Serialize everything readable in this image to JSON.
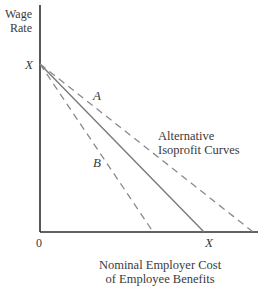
{
  "diagram": {
    "y_axis_label_line1": "Wage",
    "y_axis_label_line2": "Rate",
    "x_axis_label_line1": "Nominal Employer Cost",
    "x_axis_label_line2": "of Employee Benefits",
    "origin_label": "0",
    "y_intercept_label": "X",
    "x_intercept_label": "X",
    "curve_label_a": "A",
    "curve_label_b": "B",
    "annotation_line1": "Alternative",
    "annotation_line2": "Isoprofit Curves"
  },
  "chart_data": {
    "type": "line",
    "title": "",
    "xlabel": "Nominal Employer Cost of Employee Benefits",
    "ylabel": "Wage Rate",
    "xlim": [
      0,
      1.1
    ],
    "ylim": [
      0,
      1.0
    ],
    "grid": false,
    "series": [
      {
        "name": "isoprofit-solid",
        "style": "solid",
        "points": [
          [
            0,
            1.0
          ],
          [
            1.0,
            0
          ]
        ]
      },
      {
        "name": "isoprofit-A",
        "style": "dashed",
        "label": "A",
        "points": [
          [
            0,
            1.0
          ],
          [
            1.3,
            0
          ]
        ]
      },
      {
        "name": "isoprofit-B",
        "style": "dashed",
        "label": "B",
        "points": [
          [
            0,
            1.0
          ],
          [
            0.69,
            0
          ]
        ]
      }
    ],
    "tick_labels": {
      "x": [
        "0",
        "X"
      ],
      "y": [
        "X"
      ]
    },
    "annotations": [
      "A",
      "B",
      "Alternative Isoprofit Curves"
    ]
  }
}
